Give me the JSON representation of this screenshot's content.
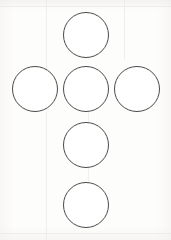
{
  "figure": {
    "type": "line-drawing",
    "canvas": {
      "width": 171,
      "height": 240,
      "background_color": "#fdfdfc"
    },
    "stroke": {
      "color": "#4a4a4a",
      "width_px": 1,
      "fill_color": "#ffffff"
    },
    "shape_count": 6,
    "arrangement": "plus-sign / cross with extended lower arm",
    "circles": [
      {
        "name": "circle-top",
        "position_label": "top",
        "center_x": 86,
        "center_y": 35,
        "diameter": 46,
        "left": 63,
        "top": 12,
        "stroke_color": "#4a4a4a",
        "stroke_width": 1,
        "fill_color": "#ffffff"
      },
      {
        "name": "circle-middle-left",
        "position_label": "middle left",
        "center_x": 35,
        "center_y": 89,
        "diameter": 46,
        "left": 12,
        "top": 66,
        "stroke_color": "#4a4a4a",
        "stroke_width": 1,
        "fill_color": "#ffffff"
      },
      {
        "name": "circle-center",
        "position_label": "center",
        "center_x": 86,
        "center_y": 89,
        "diameter": 46,
        "left": 63,
        "top": 66,
        "stroke_color": "#4a4a4a",
        "stroke_width": 1,
        "fill_color": "#ffffff"
      },
      {
        "name": "circle-middle-right",
        "position_label": "middle right",
        "center_x": 137,
        "center_y": 89,
        "diameter": 46,
        "left": 114,
        "top": 66,
        "stroke_color": "#4a4a4a",
        "stroke_width": 1,
        "fill_color": "#ffffff"
      },
      {
        "name": "circle-lower",
        "position_label": "lower",
        "center_x": 86,
        "center_y": 145,
        "diameter": 46,
        "left": 63,
        "top": 122,
        "stroke_color": "#4a4a4a",
        "stroke_width": 1,
        "fill_color": "#ffffff"
      },
      {
        "name": "circle-bottom",
        "position_label": "bottom",
        "center_x": 86,
        "center_y": 205,
        "diameter": 46,
        "left": 63,
        "top": 182,
        "stroke_color": "#4a4a4a",
        "stroke_width": 1,
        "fill_color": "#ffffff"
      }
    ]
  }
}
